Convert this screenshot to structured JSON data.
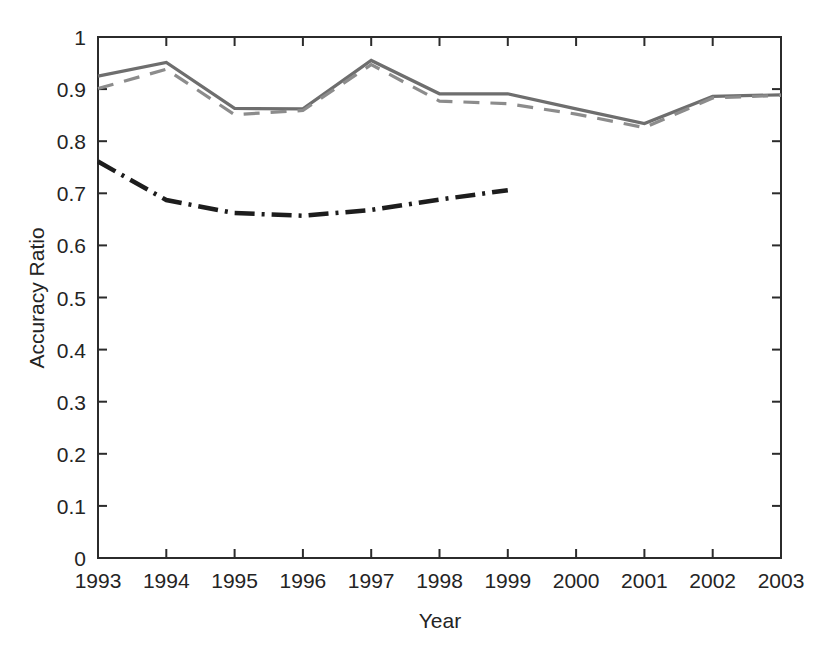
{
  "chart_data": {
    "type": "line",
    "title": "",
    "subtitle": "",
    "xlabel": "Year",
    "ylabel": "Accuracy Ratio",
    "x": [
      1993,
      1994,
      1995,
      1996,
      1997,
      1998,
      1999,
      2000,
      2001,
      2002,
      2003
    ],
    "xlim": [
      1993,
      2003
    ],
    "ylim": [
      0,
      1
    ],
    "grid": false,
    "legend": "none",
    "xtick_labels": [
      "1993",
      "1994",
      "1995",
      "1996",
      "1997",
      "1998",
      "1999",
      "2000",
      "2001",
      "2002",
      "2003"
    ],
    "ytick_labels": [
      "0",
      "0.1",
      "0.2",
      "0.3",
      "0.4",
      "0.5",
      "0.6",
      "0.7",
      "0.8",
      "0.9",
      "1"
    ],
    "ytick_values": [
      0,
      0.1,
      0.2,
      0.3,
      0.4,
      0.5,
      0.6,
      0.7,
      0.8,
      0.9,
      1
    ],
    "series": [
      {
        "name": "solid-gray-series",
        "style": "solid",
        "color": "#6e6e6e",
        "x": [
          1993,
          1994,
          1995,
          1996,
          1997,
          1998,
          1999,
          2000,
          2001,
          2002,
          2003
        ],
        "values": [
          0.925,
          0.951,
          0.863,
          0.862,
          0.955,
          0.891,
          0.891,
          0.862,
          0.834,
          0.886,
          0.889
        ]
      },
      {
        "name": "dashed-gray-series",
        "style": "dashed",
        "color": "#8c8c8c",
        "x": [
          1993,
          1994,
          1995,
          1996,
          1997,
          1998,
          1999,
          2000,
          2001,
          2002,
          2003
        ],
        "values": [
          0.901,
          0.938,
          0.851,
          0.859,
          0.947,
          0.877,
          0.872,
          0.852,
          0.826,
          0.883,
          0.888
        ]
      },
      {
        "name": "dashdot-black-series",
        "style": "dashdot",
        "color": "#1d1d1d",
        "x": [
          1993,
          1994,
          1995,
          1996,
          1997,
          1998,
          1999
        ],
        "values": [
          0.761,
          0.687,
          0.662,
          0.657,
          0.668,
          0.688,
          0.706
        ]
      }
    ]
  },
  "axes": {
    "ylabel": "Accuracy Ratio",
    "xlabel": "Year"
  },
  "ticks": {
    "x": [
      "1993",
      "1994",
      "1995",
      "1996",
      "1997",
      "1998",
      "1999",
      "2000",
      "2001",
      "2002",
      "2003"
    ],
    "y": [
      "0",
      "0.1",
      "0.2",
      "0.3",
      "0.4",
      "0.5",
      "0.6",
      "0.7",
      "0.8",
      "0.9",
      "1"
    ]
  },
  "colors": {
    "axis": "#2b2b2b",
    "solid_series": "#6e6e6e",
    "dashed_series": "#8c8c8c",
    "dashdot_series": "#1d1d1d",
    "background": "#ffffff"
  }
}
